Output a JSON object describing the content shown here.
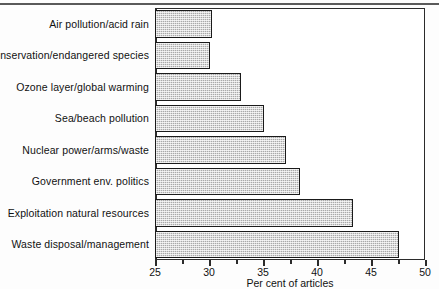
{
  "chart_data": {
    "type": "bar",
    "orientation": "horizontal",
    "title": "",
    "xlabel": "Per cent of articles",
    "ylabel": "",
    "xlim": [
      25,
      50
    ],
    "xticks": [
      25,
      30,
      35,
      40,
      45,
      50
    ],
    "xtick_labels": [
      "25",
      "30",
      "35",
      "40",
      "45",
      "50"
    ],
    "minor_tick_step": 2.5,
    "grid": false,
    "legend": null,
    "bar_color": "#a9a9a9",
    "bar_edge_color": "#1a1a1a",
    "categories": [
      "Air pollution/acid rain",
      "Conservation/endangered species",
      "Ozone layer/global warming",
      "Sea/beach pollution",
      "Nuclear power/arms/waste",
      "Government env. politics",
      "Exploitation natural resources",
      "Waste disposal/management"
    ],
    "values": [
      30.3,
      30.1,
      33.0,
      35.1,
      37.1,
      38.4,
      43.3,
      47.6
    ]
  }
}
